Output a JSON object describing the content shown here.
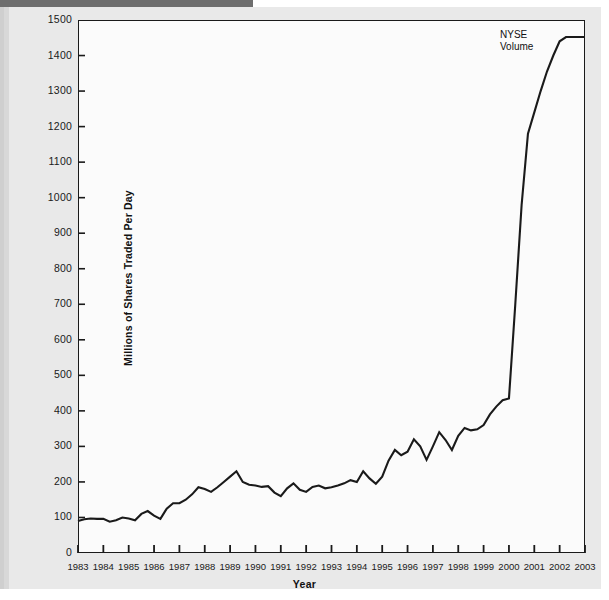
{
  "figure": {
    "background_color": "#e9e9e9",
    "plot_background_color": "#fbfbfb",
    "axis_color": "#1a1a1a",
    "line_color": "#1a1a1a"
  },
  "annotation": {
    "series_label": "NYSE\nVolume"
  },
  "chart_data": {
    "type": "line",
    "title": "",
    "subtitle": "",
    "xlabel": "Year",
    "ylabel": "Millions of Shares Traded Per Day",
    "xlim": [
      1983,
      2003
    ],
    "ylim": [
      0,
      1500
    ],
    "grid": false,
    "legend_position": "inline-annotation",
    "annotations": [
      {
        "text": "NYSE Volume",
        "x": 2000.2,
        "y": 1420
      }
    ],
    "y_ticks": [
      0,
      100,
      200,
      300,
      400,
      500,
      600,
      700,
      800,
      900,
      1000,
      1100,
      1200,
      1300,
      1400,
      1500
    ],
    "y_tick_labels": [
      "0",
      "100",
      "200",
      "300",
      "400",
      "500",
      "600",
      "700",
      "800",
      "900",
      "1000",
      "1100",
      "1200",
      "1300",
      "1400",
      "1500"
    ],
    "x_ticks": [
      1983,
      1984,
      1985,
      1986,
      1987,
      1988,
      1989,
      1990,
      1991,
      1992,
      1993,
      1994,
      1995,
      1996,
      1997,
      1998,
      1999,
      2000,
      2001,
      2002,
      2003
    ],
    "x_tick_labels": [
      "1983",
      "1984",
      "1985",
      "1986",
      "1987",
      "1988",
      "1989",
      "1990",
      "1991",
      "1992",
      "1993",
      "1994",
      "1995",
      "1996",
      "1997",
      "1998",
      "1999",
      "2000",
      "2001",
      "2002",
      "2003"
    ],
    "series": [
      {
        "name": "NYSE Volume",
        "color": "#1a1a1a",
        "x": [
          1983.0,
          1983.25,
          1983.5,
          1983.75,
          1984.0,
          1984.25,
          1984.5,
          1984.75,
          1985.0,
          1985.25,
          1985.5,
          1985.75,
          1986.0,
          1986.25,
          1986.5,
          1986.75,
          1987.0,
          1987.25,
          1987.5,
          1987.75,
          1988.0,
          1988.25,
          1988.5,
          1988.75,
          1989.0,
          1989.25,
          1989.5,
          1989.75,
          1990.0,
          1990.25,
          1990.5,
          1990.75,
          1991.0,
          1991.25,
          1991.5,
          1991.75,
          1992.0,
          1992.25,
          1992.5,
          1992.75,
          1993.0,
          1993.25,
          1993.5,
          1993.75,
          1994.0,
          1994.25,
          1994.5,
          1994.75,
          1995.0,
          1995.25,
          1995.5,
          1995.75,
          1996.0,
          1996.25,
          1996.5,
          1996.75,
          1997.0,
          1997.25,
          1997.5,
          1997.75,
          1998.0,
          1998.25,
          1998.5,
          1998.75,
          1999.0,
          1999.25,
          1999.5,
          1999.75,
          2000.0,
          2000.25,
          2000.5,
          2000.75,
          2001.0,
          2001.25,
          2001.5,
          2001.75,
          2002.0,
          2002.25,
          2002.5,
          2002.75,
          2003.0
        ],
        "values": [
          90,
          95,
          97,
          96,
          96,
          88,
          92,
          100,
          97,
          92,
          110,
          118,
          105,
          96,
          125,
          140,
          140,
          150,
          165,
          185,
          180,
          172,
          185,
          200,
          215,
          230,
          200,
          192,
          190,
          186,
          188,
          170,
          160,
          182,
          196,
          178,
          172,
          186,
          190,
          182,
          185,
          190,
          196,
          205,
          200,
          230,
          210,
          195,
          215,
          260,
          290,
          275,
          285,
          320,
          300,
          262,
          300,
          340,
          318,
          290,
          330,
          352,
          345,
          348,
          360,
          390,
          412,
          430,
          435,
          700,
          980,
          1180,
          1240,
          1300,
          1355,
          1400,
          1440,
          1452,
          1452,
          1452,
          1452
        ]
      }
    ]
  }
}
